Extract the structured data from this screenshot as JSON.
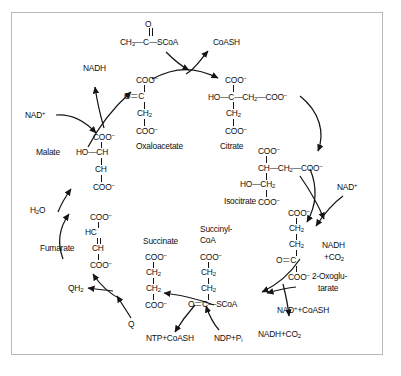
{
  "figure": {
    "background": "#ffffff",
    "border_color": "#b9b9b9",
    "ink_color": "#101010"
  },
  "metabolites": {
    "acetyl_coa": {
      "formula_main": "CH3—C—SCoA",
      "formula_text": "CH",
      "sub_3": "3",
      "carbonyl_o": "O",
      "label_left": "CH",
      "label_mid": "C",
      "label_right": "SCoA"
    },
    "oxaloacetate": {
      "name": "Oxaloacetate",
      "l1": "COO",
      "l1_sup": "−",
      "l2_left": "O",
      "l2_right": "C",
      "l3": "CH",
      "l3_sub": "2",
      "l4": "COO",
      "l4_sup": "−"
    },
    "citrate": {
      "name": "Citrate",
      "l1": "COO",
      "l1_sup": "−",
      "l2": "HO—C—CH",
      "l2_sub": "2",
      "l2_tail": "—COO",
      "l2_sup": "−",
      "l3": "CH",
      "l3_sub": "2",
      "l4": "COO",
      "l4_sup": "−"
    },
    "isocitrate": {
      "name": "Isocitrate",
      "l1": "COO",
      "l1_sup": "−",
      "l2": "CH—CH",
      "l2_sub": "2",
      "l2_tail": "—COO",
      "l2_sup": "−",
      "l3": "HO—CH",
      "l3_sub": "2",
      "l4": "COO",
      "l4_sup": "−"
    },
    "oxoglutarate": {
      "name_line1": "2-Oxoglu-",
      "name_line2": "tarate",
      "l1": "COO",
      "l1_sup": "−",
      "l2": "CH",
      "l2_sub": "2",
      "l3": "CH",
      "l3_sub": "2",
      "l4_left": "O",
      "l4_right": "C",
      "l5": "COO",
      "l5_sup": "−"
    },
    "succinyl_coa": {
      "name_line1": "Succinyl-",
      "name_line2": "CoA",
      "l1": "COO",
      "l1_sup": "−",
      "l2": "CH",
      "l2_sub": "2",
      "l3": "CH",
      "l3_sub": "2",
      "l4": "O＝C—SCoA"
    },
    "succinate": {
      "name": "Succinate",
      "l1": "COO",
      "l1_sup": "−",
      "l2": "CH",
      "l2_sub": "2",
      "l3": "CH",
      "l3_sub": "2",
      "l4": "COO",
      "l4_sup": "−"
    },
    "fumarate": {
      "name": "Fumarate",
      "l1": "COO",
      "l1_sup": "−",
      "l2": "HC",
      "l3": "CH",
      "l4": "COO",
      "l4_sup": "−"
    },
    "malate": {
      "name": "Malate",
      "l1": "COO",
      "l1_sup": "−",
      "l2": "HO—CH",
      "l3": "CH",
      "l4": "COO",
      "l4_sup": "−"
    }
  },
  "cofactors": {
    "coash_out": "CoASH",
    "nadh_top_left": "NADH",
    "nad_plus_left": "NAD",
    "nad_plus_left_sup": "+",
    "water_in": "H",
    "water_in_sub": "2",
    "water_in_tail": "O",
    "q_in": "Q",
    "qh2_out": "QH",
    "qh2_out_sub": "2",
    "ntp_out": "NTP+CoASH",
    "ndp_in": "NDP+P",
    "ndp_in_sub": "i",
    "nad_coash_in": "NAD",
    "nad_coash_in_sup": "+",
    "nad_coash_in_tail": "+CoASH",
    "nadh_co2_out": "NADH+CO",
    "nadh_co2_out_sub": "2",
    "nad_plus_right": "NAD",
    "nad_plus_right_sup": "+",
    "nadh_right_line1": "NADH",
    "nadh_right_line2_head": "+CO",
    "nadh_right_line2_sub": "2"
  }
}
